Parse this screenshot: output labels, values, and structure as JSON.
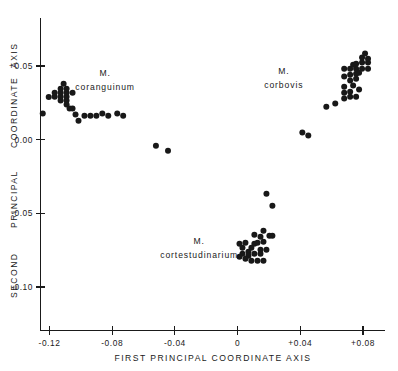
{
  "chart_data": {
    "type": "scatter",
    "title": "",
    "xlabel": "FIRST PRINCIPAL COORDINATE AXIS",
    "ylabel_words": [
      "SECOND",
      "PRINCIPAL",
      "COORDINATE",
      "AXIS"
    ],
    "ylabel": "SECOND PRINCIPAL COORDINATE AXIS",
    "xlim": [
      -0.132,
      0.093
    ],
    "ylim": [
      -0.1,
      0.065
    ],
    "grid": false,
    "legend": "none",
    "xticks": [
      -0.12,
      -0.08,
      -0.04,
      0,
      0.04,
      0.08
    ],
    "xticklabels": [
      "-0.12",
      "-0.08",
      "-0.04",
      "0",
      "+0.04",
      "+0.08"
    ],
    "yticks": [
      0.05,
      0.0,
      -0.05,
      -0.1
    ],
    "yticklabels": [
      "+0.05",
      "0.00",
      "-0.05",
      "-0.10"
    ],
    "annotations": [
      {
        "name": "coranguinum-label",
        "lines": [
          "M.",
          "coranguinum"
        ],
        "x": -0.0845,
        "y": 0.0435
      },
      {
        "name": "corbovis-label",
        "lines": [
          "M.",
          "corbovis"
        ],
        "x": 0.0295,
        "y": 0.0445
      },
      {
        "name": "cortestudinarium-label",
        "lines": [
          "M.",
          "cortestudinarium"
        ],
        "x": -0.0245,
        "y": -0.0705
      }
    ],
    "series": [
      {
        "name": "M. coranguinum",
        "marker": "filled-circle",
        "color": "#181818",
        "points": [
          [
            -0.1205,
            0.0289
          ],
          [
            -0.1167,
            0.0292
          ],
          [
            -0.1167,
            0.0319
          ],
          [
            -0.1129,
            0.0292
          ],
          [
            -0.1129,
            0.0319
          ],
          [
            -0.1129,
            0.0346
          ],
          [
            -0.1091,
            0.0292
          ],
          [
            -0.1091,
            0.0319
          ],
          [
            -0.1091,
            0.0346
          ],
          [
            -0.1129,
            0.0265
          ],
          [
            -0.1091,
            0.0265
          ],
          [
            -0.1053,
            0.0319
          ],
          [
            -0.111,
            0.038
          ],
          [
            -0.1091,
            0.0238
          ],
          [
            -0.1072,
            0.0211
          ],
          [
            -0.1243,
            0.0177
          ],
          [
            -0.1053,
            0.0211
          ],
          [
            -0.1034,
            0.017
          ],
          [
            -0.1015,
            0.0129
          ],
          [
            -0.0977,
            0.0163
          ],
          [
            -0.0939,
            0.0163
          ],
          [
            -0.0901,
            0.0163
          ],
          [
            -0.0863,
            0.0177
          ],
          [
            -0.0825,
            0.0163
          ],
          [
            -0.0768,
            0.0177
          ],
          [
            -0.073,
            0.0163
          ]
        ]
      },
      {
        "name": "intermediate-outliers",
        "marker": "filled-circle",
        "color": "#181818",
        "points": [
          [
            -0.0521,
            -0.0041
          ],
          [
            -0.0444,
            -0.0075
          ]
        ]
      },
      {
        "name": "M. cortestudinarium",
        "marker": "filled-circle",
        "color": "#181818",
        "points": [
          [
            0.0184,
            -0.0367
          ],
          [
            0.0222,
            -0.0448
          ],
          [
            0.0165,
            -0.0618
          ],
          [
            0.0146,
            -0.0659
          ],
          [
            0.0203,
            -0.0652
          ],
          [
            0.0012,
            -0.0707
          ],
          [
            0.005,
            -0.07
          ],
          [
            0.0107,
            -0.0707
          ],
          [
            0.0127,
            -0.07
          ],
          [
            0.0165,
            -0.0693
          ],
          [
            0.0222,
            -0.0652
          ],
          [
            0.0031,
            -0.0734
          ],
          [
            0.0069,
            -0.0761
          ],
          [
            0.0146,
            -0.0748
          ],
          [
            0.0184,
            -0.0748
          ],
          [
            0.0031,
            -0.0775
          ],
          [
            0.0069,
            -0.0788
          ],
          [
            0.0107,
            -0.0775
          ],
          [
            0.0146,
            -0.0775
          ],
          [
            0.0012,
            -0.0795
          ],
          [
            0.005,
            -0.0809
          ],
          [
            0.0088,
            -0.0822
          ],
          [
            0.0127,
            -0.0822
          ],
          [
            0.0165,
            -0.0822
          ],
          [
            0.0107,
            -0.0645
          ],
          [
            0.0088,
            -0.0734
          ]
        ]
      },
      {
        "name": "M. corbovis",
        "marker": "filled-circle",
        "color": "#181818",
        "points": [
          [
            0.0413,
            0.0048
          ],
          [
            0.0451,
            0.0028
          ],
          [
            0.0566,
            0.0224
          ],
          [
            0.0623,
            0.0245
          ],
          [
            0.068,
            0.0279
          ],
          [
            0.0718,
            0.0292
          ],
          [
            0.0756,
            0.0292
          ],
          [
            0.068,
            0.0319
          ],
          [
            0.0718,
            0.0326
          ],
          [
            0.068,
            0.036
          ],
          [
            0.0737,
            0.0367
          ],
          [
            0.0775,
            0.034
          ],
          [
            0.0718,
            0.0401
          ],
          [
            0.0756,
            0.0414
          ],
          [
            0.068,
            0.0428
          ],
          [
            0.0718,
            0.0441
          ],
          [
            0.0756,
            0.0448
          ],
          [
            0.068,
            0.0482
          ],
          [
            0.0718,
            0.0482
          ],
          [
            0.0756,
            0.0482
          ],
          [
            0.0794,
            0.0482
          ],
          [
            0.0832,
            0.0482
          ],
          [
            0.0756,
            0.0516
          ],
          [
            0.0794,
            0.0523
          ],
          [
            0.0832,
            0.0523
          ],
          [
            0.0794,
            0.0557
          ],
          [
            0.0832,
            0.055
          ],
          [
            0.0813,
            0.0584
          ],
          [
            0.0775,
            0.0455
          ],
          [
            0.0737,
            0.0509
          ]
        ]
      }
    ]
  }
}
